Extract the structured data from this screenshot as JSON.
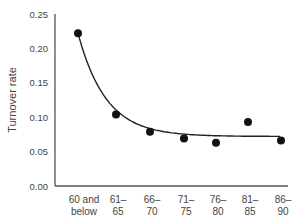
{
  "chart_data": {
    "type": "scatter",
    "title": "",
    "xlabel": "",
    "ylabel": "Turnover rate",
    "ylim": [
      0,
      0.25
    ],
    "yticks": [
      "0.00",
      "0.05",
      "0.10",
      "0.15",
      "0.20",
      "0.25"
    ],
    "categories": [
      [
        "60 and",
        "below"
      ],
      [
        "61–",
        "65"
      ],
      [
        "66–",
        "70"
      ],
      [
        "71–",
        "75"
      ],
      [
        "76–",
        "80"
      ],
      [
        "81–",
        "85"
      ],
      [
        "86–",
        "90"
      ]
    ],
    "values": [
      0.222,
      0.104,
      0.079,
      0.069,
      0.063,
      0.093,
      0.066
    ],
    "trendline": "smooth fitted curve (decaying) through points",
    "grid": false,
    "legend": null,
    "colors": {
      "points": "#111111",
      "line": "#222222",
      "axis": "#555555"
    }
  }
}
